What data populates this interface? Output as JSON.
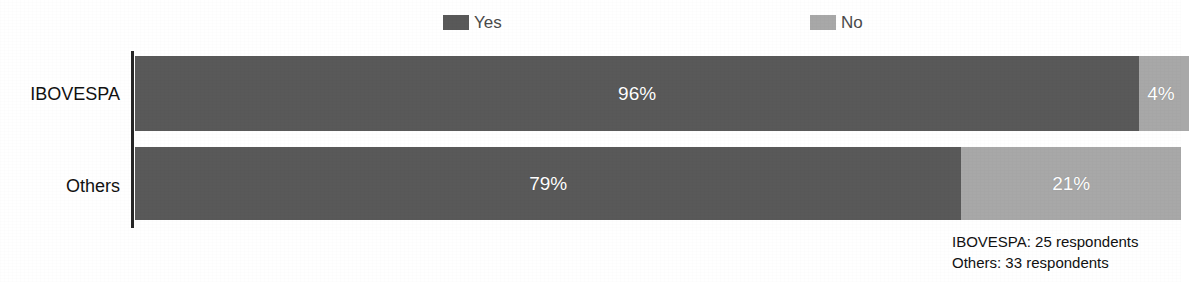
{
  "legend": {
    "position": "top-center",
    "entries": [
      {
        "label": "Yes",
        "color": "#595959",
        "swatch_icon": "legend-swatch-icon"
      },
      {
        "label": "No",
        "color": "#a8a8a8",
        "swatch_icon": "legend-swatch-icon"
      }
    ]
  },
  "footnotes": {
    "line1": "IBOVESPA: 25 respondents",
    "line2": "Others: 33 respondents"
  },
  "chart_data": {
    "type": "bar",
    "orientation": "horizontal",
    "stacked": true,
    "stacked_mode": "percent",
    "title": "",
    "subtitle": "",
    "xlabel": "",
    "ylabel": "",
    "xlim": [
      0,
      100
    ],
    "grid": false,
    "legend_position": "top-center",
    "categories": [
      "IBOVESPA",
      "Others"
    ],
    "series": [
      {
        "name": "Yes",
        "color": "#595959",
        "values": [
          96,
          79
        ],
        "value_labels": [
          "96%",
          "79%"
        ]
      },
      {
        "name": "No",
        "color": "#a8a8a8",
        "values": [
          4,
          21
        ],
        "value_labels": [
          "4%",
          "21%"
        ]
      }
    ],
    "annotations": [
      "IBOVESPA: 25 respondents",
      "Others: 33 respondents"
    ]
  }
}
